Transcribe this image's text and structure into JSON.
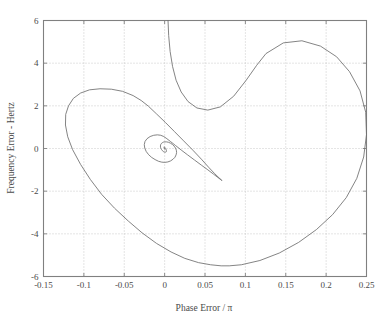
{
  "figure": {
    "background": "#ffffff",
    "axes_color": "#808080",
    "grid_color": "#bdbdbd",
    "curve_color": "#6e6e6e"
  },
  "chart_data": {
    "type": "line",
    "title": "",
    "xlabel": "Phase Error / π",
    "ylabel": "Frequency Error - Hertz",
    "xlim": [
      -0.15,
      0.25
    ],
    "ylim": [
      -6,
      6
    ],
    "xticks": [
      -0.15,
      -0.1,
      -0.05,
      0,
      0.05,
      0.1,
      0.15,
      0.2,
      0.25
    ],
    "xticklabels": [
      "-0.15",
      "-0.1",
      "-0.05",
      "0",
      "0.05",
      "0.1",
      "0.15",
      "0.2",
      "0.25"
    ],
    "yticks": [
      -6,
      -4,
      -2,
      0,
      2,
      4,
      6
    ],
    "yticklabels": [
      "-6",
      "-4",
      "-2",
      "0",
      "2",
      "4",
      "6"
    ],
    "grid": true,
    "grid_style": "dotted",
    "legend": null,
    "series": [
      {
        "name": "phase-plane trajectory",
        "description": "Inward spiral converging to the origin (0,0)",
        "x": [
          0.0042,
          0.005,
          0.0068,
          0.0098,
          0.0142,
          0.0205,
          0.029,
          0.04,
          0.0535,
          0.069,
          0.0855,
          0.101,
          0.114,
          0.1255,
          0.147,
          0.17,
          0.193,
          0.213,
          0.229,
          0.242,
          0.249,
          0.25,
          0.2465,
          0.238,
          0.225,
          0.208,
          0.188,
          0.166,
          0.142,
          0.118,
          0.095,
          0.08,
          0.07,
          0.057,
          0.042,
          0.025,
          0.008,
          -0.01,
          -0.028,
          -0.045,
          -0.062,
          -0.078,
          -0.092,
          -0.104,
          -0.114,
          -0.12,
          -0.1228,
          -0.1225,
          -0.119,
          -0.113,
          -0.104,
          -0.093,
          -0.08,
          -0.066,
          -0.052,
          -0.039,
          -0.029,
          -0.02,
          -0.01,
          0.001,
          0.012,
          0.0235,
          0.035,
          0.0455,
          0.0545,
          0.062,
          0.0675,
          0.0705,
          0.071,
          0.0695,
          0.066,
          0.0605,
          0.0535,
          0.0455,
          0.037,
          0.0285,
          0.0205,
          0.0135,
          0.0075,
          0.0028,
          -0.001,
          -0.0048,
          -0.009,
          -0.0135,
          -0.018,
          -0.0218,
          -0.0243,
          -0.0252,
          -0.0246,
          -0.0228,
          -0.0198,
          -0.016,
          -0.0118,
          -0.0075,
          -0.0035,
          0.0003,
          0.004,
          0.0075,
          0.0105,
          0.0128,
          0.0142,
          0.0148,
          0.0145,
          0.0135,
          0.0118,
          0.0096,
          0.0072,
          0.0048,
          0.0025,
          0.0004,
          -0.0014,
          -0.0029,
          -0.0041,
          -0.0049,
          -0.0052,
          -0.0051,
          -0.0046,
          -0.0038,
          -0.0028,
          -0.0017,
          -0.0006,
          0.0004,
          0.0012,
          0.0018,
          0.0022,
          0.0023,
          0.0022,
          0.0019,
          0.0015,
          0.001,
          0.0005,
          0.0001,
          -0.0003,
          -0.0006,
          -0.0008,
          -0.0009,
          -0.0008,
          -0.0007,
          -0.0005,
          -0.0003,
          -0.0001,
          0.0001,
          0.0002,
          0.0003,
          0.0003,
          0.0003,
          0.0002,
          0.0001,
          0.0,
          0.0
        ],
        "y": [
          6.0,
          5.3,
          4.55,
          3.85,
          3.2,
          2.65,
          2.2,
          1.9,
          1.8,
          1.95,
          2.45,
          3.2,
          3.9,
          4.45,
          4.95,
          5.05,
          4.8,
          4.3,
          3.6,
          2.7,
          1.7,
          0.65,
          -0.4,
          -1.4,
          -2.3,
          -3.1,
          -3.8,
          -4.4,
          -4.9,
          -5.25,
          -5.45,
          -5.5,
          -5.5,
          -5.45,
          -5.35,
          -5.15,
          -4.85,
          -4.45,
          -3.95,
          -3.4,
          -2.8,
          -2.15,
          -1.45,
          -0.75,
          -0.05,
          0.55,
          1.1,
          1.6,
          2.0,
          2.35,
          2.6,
          2.75,
          2.8,
          2.78,
          2.68,
          2.48,
          2.25,
          1.98,
          1.62,
          1.22,
          0.8,
          0.36,
          -0.08,
          -0.5,
          -0.88,
          -1.18,
          -1.38,
          -1.48,
          -1.5,
          -1.46,
          -1.36,
          -1.2,
          -1.0,
          -0.78,
          -0.54,
          -0.3,
          -0.07,
          0.14,
          0.32,
          0.46,
          0.56,
          0.62,
          0.64,
          0.62,
          0.56,
          0.46,
          0.33,
          0.18,
          0.02,
          -0.14,
          -0.29,
          -0.42,
          -0.52,
          -0.6,
          -0.64,
          -0.65,
          -0.63,
          -0.58,
          -0.5,
          -0.41,
          -0.3,
          -0.19,
          -0.08,
          0.02,
          0.11,
          0.19,
          0.25,
          0.29,
          0.31,
          0.31,
          0.3,
          0.27,
          0.23,
          0.18,
          0.12,
          0.06,
          0.0,
          -0.05,
          -0.1,
          -0.14,
          -0.16,
          -0.17,
          -0.17,
          -0.16,
          -0.14,
          -0.11,
          -0.08,
          -0.05,
          -0.02,
          0.01,
          0.04,
          0.06,
          0.07,
          0.08,
          0.08,
          0.07,
          0.06,
          0.04,
          0.02,
          0.01,
          -0.01,
          -0.02,
          -0.03,
          -0.04,
          -0.04,
          -0.03,
          -0.02,
          -0.01,
          0.0,
          0.0
        ]
      }
    ]
  }
}
